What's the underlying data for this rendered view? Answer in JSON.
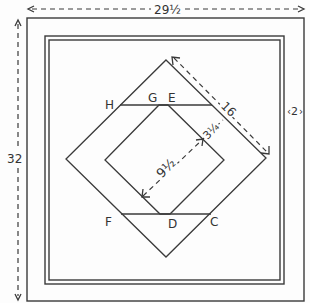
{
  "diagram": {
    "type": "quilt-block-layout",
    "dimensions": {
      "overall_width": "29½",
      "overall_height": "32",
      "border_width": "2",
      "diamond_side": "16",
      "band_width": "3¼",
      "inner_square_side": "9½"
    },
    "point_labels": {
      "H": "H",
      "G": "G",
      "E": "E",
      "F": "F",
      "D": "D",
      "C": "C"
    },
    "colors": {
      "line": "#3a3a3a",
      "background": "#fdfdfd"
    }
  }
}
